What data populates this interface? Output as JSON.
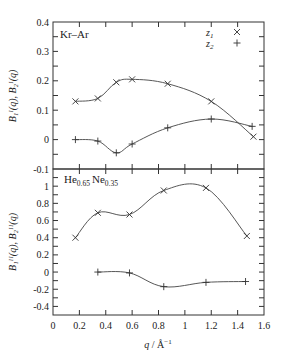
{
  "chart_data": [
    {
      "type": "line",
      "panel": "top",
      "title": "Kr–Ar",
      "xlabel": "q / Å⁻¹",
      "ylabel": "B₁ᴵ(q), B₂ᴵ(q)",
      "xlim": [
        0,
        1.6
      ],
      "ylim": [
        -0.1,
        0.4
      ],
      "yticks": [
        -0.1,
        0,
        0.1,
        0.2,
        0.3,
        0.4
      ],
      "ytick_labels": [
        "-0.1",
        "0",
        "0.1",
        "0.2",
        "0.3",
        "0.4"
      ],
      "grid": false,
      "legend_position": "upper right",
      "series": [
        {
          "name": "z1",
          "marker": "x",
          "x": [
            0.17,
            0.34,
            0.48,
            0.6,
            0.87,
            1.2,
            1.52
          ],
          "y": [
            0.13,
            0.14,
            0.195,
            0.205,
            0.19,
            0.13,
            0.01
          ]
        },
        {
          "name": "z2",
          "marker": "+",
          "x": [
            0.17,
            0.34,
            0.48,
            0.6,
            0.87,
            1.2,
            1.51
          ],
          "y": [
            0.0,
            -0.005,
            -0.045,
            -0.015,
            0.04,
            0.07,
            0.045
          ]
        }
      ]
    },
    {
      "type": "line",
      "panel": "bottom",
      "title": "He0.65 Ne0.35",
      "xlabel": "q / Å⁻¹",
      "ylabel": "B₁ᴵᴵ(q), B₂ᴵᴵ(q)",
      "xlim": [
        0,
        1.6
      ],
      "ylim": [
        -0.5,
        1.2
      ],
      "xticks": [
        0,
        0.2,
        0.4,
        0.6,
        0.8,
        1,
        1.2,
        1.4,
        1.6
      ],
      "xtick_labels": [
        "0",
        "0.2",
        "0.4",
        "0.6",
        "0.8",
        "1",
        "1.2",
        "1.4",
        "1.6"
      ],
      "yticks": [
        -0.4,
        -0.2,
        0,
        0.2,
        0.4,
        0.6,
        0.8,
        1
      ],
      "ytick_labels": [
        "-0.4",
        "-0.2",
        "0",
        "0.2",
        "0.4",
        "0.6",
        "0.8",
        "1"
      ],
      "grid": false,
      "series": [
        {
          "name": "z1",
          "marker": "x",
          "x": [
            0.17,
            0.34,
            0.58,
            0.84,
            1.16,
            1.47
          ],
          "y": [
            0.4,
            0.69,
            0.67,
            0.95,
            0.98,
            0.42
          ]
        },
        {
          "name": "z2",
          "marker": "+",
          "x": [
            0.34,
            0.58,
            0.84,
            1.16,
            1.46
          ],
          "y": [
            0.0,
            -0.01,
            -0.17,
            -0.12,
            -0.11
          ]
        }
      ]
    }
  ],
  "labels": {
    "top_title": "Kr–Ar",
    "bottom_title_he": "He",
    "bottom_title_he_sub": "0.65",
    "bottom_title_ne": "Ne",
    "bottom_title_ne_sub": "0.35",
    "legend_z1": "z",
    "legend_z1_sub": "1",
    "legend_z2": "z",
    "legend_z2_sub": "2",
    "xlabel_q": "q",
    "xlabel_unit": " / Å",
    "xlabel_exp": "−1",
    "ylabel_top": "B₁ᴵ(q),  B₂ᴵ(q)",
    "ylabel_bottom": "B₁ᴵᴵ(q),  B₂ᴵᴵ(q)"
  }
}
